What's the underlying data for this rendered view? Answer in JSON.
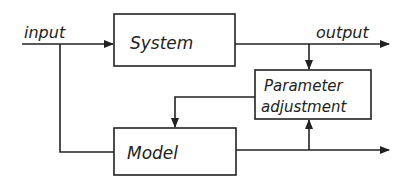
{
  "diagram": {
    "type": "block-diagram",
    "title": "",
    "blocks": [
      {
        "id": "system",
        "label": "System"
      },
      {
        "id": "parameter_adjustment",
        "label_line1": "Parameter",
        "label_line2": "adjustment"
      },
      {
        "id": "model",
        "label": "Model"
      }
    ],
    "signals": {
      "input": "input",
      "output": "output"
    },
    "edges": [
      {
        "from": "input",
        "to": "system"
      },
      {
        "from": "input",
        "to": "model"
      },
      {
        "from": "system",
        "to": "output"
      },
      {
        "from": "system_output",
        "to": "parameter_adjustment"
      },
      {
        "from": "model_output",
        "to": "parameter_adjustment"
      },
      {
        "from": "parameter_adjustment",
        "to": "model"
      }
    ],
    "colors": {
      "line": "#222222",
      "background": "#ffffff"
    }
  }
}
